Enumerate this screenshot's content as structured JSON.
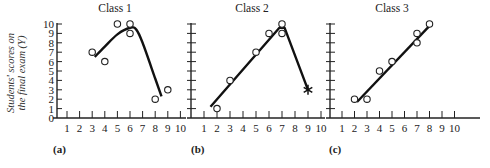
{
  "figure": {
    "ylabel_line1": "Students' scores on",
    "ylabel_line2": "the final exam (Y)",
    "panel_labels": [
      "(a)",
      "(b)",
      "(c)"
    ],
    "titles": [
      "Class 1",
      "Class 2",
      "Class 3"
    ]
  },
  "chart_data": [
    {
      "type": "scatter",
      "title": "Class 1",
      "panel": "(a)",
      "xlabel": "",
      "ylabel": "Students' scores on the final exam (Y)",
      "xlim": [
        0,
        10
      ],
      "ylim": [
        0,
        10
      ],
      "x_ticks": [
        1,
        2,
        3,
        4,
        5,
        6,
        7,
        8,
        9,
        10
      ],
      "y_ticks": [
        0,
        1,
        2,
        3,
        4,
        5,
        6,
        7,
        8,
        9,
        10
      ],
      "points": [
        [
          3,
          7
        ],
        [
          4,
          6
        ],
        [
          5,
          10
        ],
        [
          6,
          10
        ],
        [
          6,
          9
        ],
        [
          8,
          2
        ],
        [
          9,
          3
        ]
      ],
      "fit": {
        "kind": "curve",
        "points": [
          [
            3.2,
            6.5
          ],
          [
            4,
            7.6
          ],
          [
            5,
            8.9
          ],
          [
            6,
            9.6
          ],
          [
            6.5,
            9.4
          ],
          [
            7,
            8
          ],
          [
            8,
            4.2
          ],
          [
            8.5,
            2.3
          ]
        ]
      }
    },
    {
      "type": "scatter",
      "title": "Class 2",
      "panel": "(b)",
      "xlim": [
        0,
        10
      ],
      "ylim": [
        0,
        10
      ],
      "x_ticks": [
        1,
        2,
        3,
        4,
        5,
        6,
        7,
        8,
        9,
        10
      ],
      "points": [
        [
          2,
          1
        ],
        [
          3,
          4
        ],
        [
          5,
          7
        ],
        [
          6,
          9
        ],
        [
          7,
          10
        ],
        [
          7,
          9
        ]
      ],
      "outlier": {
        "x": 9,
        "y": 3,
        "marker": "asterisk"
      },
      "fit": {
        "kind": "piecewise",
        "points": [
          [
            1.5,
            1.2
          ],
          [
            6.8,
            9.6
          ],
          [
            7.2,
            9.6
          ],
          [
            9,
            3
          ]
        ]
      }
    },
    {
      "type": "scatter",
      "title": "Class 3",
      "panel": "(c)",
      "xlim": [
        0,
        10
      ],
      "ylim": [
        0,
        10
      ],
      "x_ticks": [
        1,
        2,
        3,
        4,
        5,
        6,
        7,
        8,
        9,
        10
      ],
      "points": [
        [
          2,
          2
        ],
        [
          3,
          2
        ],
        [
          4,
          5
        ],
        [
          5,
          6
        ],
        [
          7,
          9
        ],
        [
          7,
          8
        ],
        [
          8,
          10
        ]
      ],
      "fit": {
        "kind": "line",
        "points": [
          [
            2.2,
            1.7
          ],
          [
            8,
            9.8
          ]
        ]
      }
    }
  ]
}
